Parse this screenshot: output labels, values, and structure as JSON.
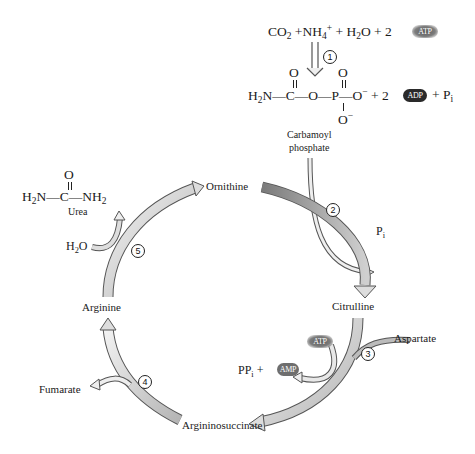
{
  "diagram": {
    "reaction1": {
      "reactants": [
        "CO2",
        "NH4+",
        "H2O",
        "2 ATP"
      ],
      "products": [
        "Carbamoyl phosphate",
        "2 ADP",
        "Pi"
      ],
      "step": "1"
    },
    "labels": {
      "co2": "CO",
      "co2_sub": "2",
      "plus": "+",
      "nh4": "NH",
      "nh4_sub": "4",
      "nh4_sup": "+",
      "h2o_h": "H",
      "h2o_sub": "2",
      "h2o_o": "O",
      "two": "2",
      "atp": "ATP",
      "adp": "ADP",
      "amp": "AMP",
      "carbamoyl_formula_left": "H",
      "carbamoyl_formula_sub": "2",
      "carbamoyl_formula_rest": "N—C—O—P—O",
      "carbamoyl_charge": "−",
      "carbamoyl_o_top1": "O",
      "carbamoyl_o_top2": "O",
      "carbamoyl_o_bottom": "O",
      "carbamoyl_o_bottom_charge": "−",
      "plus_two": "+ 2",
      "plus_pi": "+ P",
      "pi_sub": "i",
      "carbamoyl_name_1": "Carbamoyl",
      "carbamoyl_name_2": "phosphate",
      "urea_formula_left": "H",
      "urea_sub1": "2",
      "urea_mid": "N—C—NH",
      "urea_sub2": "2",
      "urea_o": "O",
      "urea_name": "Urea",
      "water_h": "H",
      "water_sub": "2",
      "water_o": "O",
      "ornithine": "Ornithine",
      "citrulline": "Citrulline",
      "aspartate": "Aspartate",
      "argininosuccinate": "Argininosuccinate",
      "arginine": "Arginine",
      "fumarate": "Fumarate",
      "pi": "P",
      "pi_i": "i",
      "ppi": "PP",
      "ppi_i": "i",
      "ppi_plus": "+"
    },
    "steps": [
      "1",
      "2",
      "3",
      "4",
      "5"
    ],
    "colors": {
      "arrow_fill_light": "#e6e6e6",
      "arrow_fill_dark": "#8c8c8c",
      "arrow_stroke": "#555555",
      "atp_badge": "#6f6f6f",
      "adp_badge": "#2a2a2a",
      "amp_badge": "#6e6e6e"
    }
  }
}
